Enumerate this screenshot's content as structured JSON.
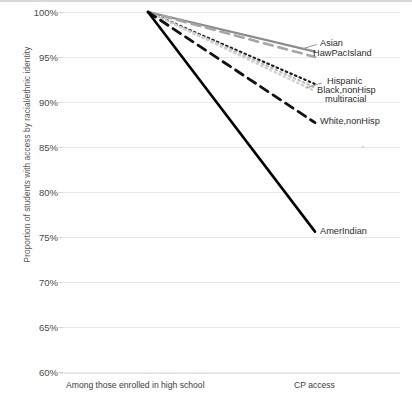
{
  "chart_data": {
    "type": "line",
    "title": "",
    "xlabel": "",
    "ylabel": "Proportion of students with access by racial/ethnic identity",
    "categories": [
      "Among those enrolled in high school",
      "CP access"
    ],
    "ylim": [
      60,
      100
    ],
    "ytick_labels": [
      "100%",
      "95%",
      "90%",
      "85%",
      "80%",
      "75%",
      "70%",
      "65%",
      "60%"
    ],
    "ytick_values": [
      100,
      95,
      90,
      85,
      80,
      75,
      70,
      65,
      60
    ],
    "grid": true,
    "legend_position": "right-inline-labels",
    "series": [
      {
        "name": "Asian",
        "values": [
          100,
          95.6
        ],
        "style": "solid",
        "color": "#8c8c8c",
        "width": 2.2
      },
      {
        "name": "HawPacIsland",
        "values": [
          100,
          95.0
        ],
        "style": "dashed",
        "color": "#a6a6a6",
        "width": 2.6
      },
      {
        "name": "Hispanic",
        "values": [
          100,
          92.0
        ],
        "style": "dotted",
        "color": "#1f1f1f",
        "width": 2.2
      },
      {
        "name": "Black,nonHisp",
        "values": [
          100,
          91.6
        ],
        "style": "dotted",
        "color": "#bdbdbd",
        "width": 2.2
      },
      {
        "name": "multiracial",
        "values": [
          100,
          91.2
        ],
        "style": "dotted",
        "color": "#d0d0d0",
        "width": 2.2
      },
      {
        "name": "White,nonHisp",
        "values": [
          100,
          87.7
        ],
        "style": "dashed",
        "color": "#111111",
        "width": 2.8
      },
      {
        "name": "AmerIndian",
        "values": [
          100,
          75.6
        ],
        "style": "solid",
        "color": "#000000",
        "width": 2.6
      }
    ],
    "annotations": [
      {
        "text": "Asian",
        "x": 320,
        "y": 44
      },
      {
        "text": "HawPacIsland",
        "x": 313,
        "y": 55
      },
      {
        "text": "Hispanic",
        "x": 327,
        "y": 82
      },
      {
        "text": "Black,nonHisp",
        "x": 317,
        "y": 91
      },
      {
        "text": "multiracial",
        "x": 325,
        "y": 100
      },
      {
        "text": "White,nonHisp",
        "x": 320,
        "y": 122
      },
      {
        "text": "AmerIndian",
        "x": 320,
        "y": 232
      }
    ]
  },
  "axis": {
    "y_title": "Proportion of students with access by racial/ethnic identity",
    "x_category_left": "Among those enrolled in high school",
    "x_category_right": "CP access"
  }
}
